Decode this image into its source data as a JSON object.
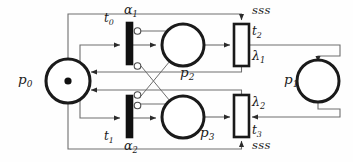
{
  "diagram": {
    "type": "petri-net",
    "colors": {
      "stroke": "#2b2b2b",
      "thin_stroke": "#6e6e6e",
      "fill": "#ffffff",
      "token": "#111111",
      "background": "#fefefe"
    },
    "places": [
      {
        "id": "p0",
        "label": "p",
        "sub": "0",
        "cx": 68,
        "cy": 81,
        "r": 22,
        "tokens": 1,
        "label_x": 18,
        "label_y": 73
      },
      {
        "id": "p1",
        "label": "p",
        "sub": "1",
        "cx": 318,
        "cy": 81,
        "r": 21,
        "tokens": 0,
        "label_x": 284,
        "label_y": 73
      },
      {
        "id": "p2",
        "label": "p",
        "sub": "2",
        "cx": 183,
        "cy": 45,
        "r": 21,
        "tokens": 0,
        "label_x": 180,
        "label_y": 66
      },
      {
        "id": "p3",
        "label": "p",
        "sub": "3",
        "cx": 183,
        "cy": 117,
        "r": 21,
        "tokens": 0,
        "label_x": 200,
        "label_y": 128
      }
    ],
    "transitions": [
      {
        "id": "t0",
        "kind": "immediate",
        "label": "t",
        "sub": "0",
        "rate": "α",
        "rate_sub": "1",
        "x": 126,
        "y": 22,
        "w": 7,
        "h": 43,
        "label_x": 104,
        "label_y": 12,
        "rate_x": 124,
        "rate_y": 6
      },
      {
        "id": "t1",
        "kind": "immediate",
        "label": "t",
        "sub": "1",
        "rate": "α",
        "rate_sub": "2",
        "x": 126,
        "y": 95,
        "w": 7,
        "h": 43,
        "label_x": 104,
        "label_y": 131,
        "rate_x": 124,
        "rate_y": 140
      },
      {
        "id": "t2",
        "kind": "timed",
        "label": "t",
        "sub": "2",
        "rate": "λ",
        "rate_sub": "1",
        "x": 234,
        "y": 24,
        "w": 15,
        "h": 42,
        "label_x": 252,
        "label_y": 26,
        "rate_x": 252,
        "rate_y": 52,
        "guard": "sss",
        "guard_x": 253,
        "guard_y": 6
      },
      {
        "id": "t3",
        "kind": "timed",
        "label": "t",
        "sub": "3",
        "rate": "λ",
        "rate_sub": "2",
        "x": 234,
        "y": 95,
        "w": 15,
        "h": 42,
        "label_x": 252,
        "label_y": 125,
        "rate_x": 252,
        "rate_y": 97,
        "guard": "sss",
        "guard_x": 253,
        "guard_y": 140
      }
    ],
    "arc_labels": {
      "alpha1": "α",
      "alpha2": "α",
      "lambda1": "λ",
      "lambda2": "λ",
      "sss_top": "sss",
      "sss_bottom": "sss"
    },
    "arcs": [
      {
        "from": "p0",
        "to": "t0",
        "kind": "normal"
      },
      {
        "from": "p0",
        "to": "t1",
        "kind": "normal"
      },
      {
        "from": "t0",
        "to": "p2",
        "kind": "normal"
      },
      {
        "from": "t1",
        "to": "p3",
        "kind": "normal"
      },
      {
        "from": "p2",
        "to": "t2",
        "kind": "normal"
      },
      {
        "from": "p3",
        "to": "t3",
        "kind": "normal"
      },
      {
        "from": "t2",
        "to": "p1",
        "kind": "normal"
      },
      {
        "from": "p1",
        "to": "t3",
        "kind": "normal"
      },
      {
        "from": "t2",
        "to": "p0",
        "kind": "normal"
      },
      {
        "from": "t3",
        "to": "p0",
        "kind": "normal"
      },
      {
        "from": "p0",
        "to": "t2",
        "kind": "normal"
      },
      {
        "from": "p0",
        "to": "t3",
        "kind": "normal"
      },
      {
        "from": "p2",
        "to": "t0",
        "kind": "inhibitor"
      },
      {
        "from": "p2",
        "to": "t1",
        "kind": "inhibitor"
      },
      {
        "from": "p3",
        "to": "t1",
        "kind": "inhibitor"
      },
      {
        "from": "p3",
        "to": "t0",
        "kind": "inhibitor"
      }
    ]
  }
}
